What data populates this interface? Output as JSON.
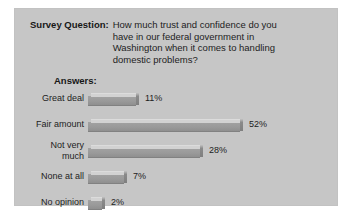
{
  "panel": {
    "background_color": "#c6c6c6",
    "page_background_color": "#ffffff"
  },
  "header": {
    "label": "Survey Question:",
    "question_lines": [
      "How much trust and confidence do you",
      "have in our federal government in",
      "Washington when it comes to handling",
      "domestic problems?"
    ],
    "question_full": "How much trust and confidence do you have in our federal government in Washington when it comes to handling domestic problems?"
  },
  "answers_heading": "Answers:",
  "chart_data": {
    "type": "bar",
    "orientation": "horizontal",
    "title": "How much trust and confidence do you have in our federal government in Washington when it comes to handling domestic problems?",
    "xlabel": "",
    "ylabel": "Answers",
    "grid": false,
    "legend": null,
    "value_suffix": "%",
    "categories": [
      "Great deal",
      "Fair amount",
      "Not very much",
      "None at all",
      "No opinion"
    ],
    "values": [
      11,
      52,
      28,
      7,
      2
    ],
    "value_labels": [
      "11%",
      "52%",
      "28%",
      "7%",
      "2%"
    ],
    "bar_pixel_widths": [
      48,
      152,
      112,
      36,
      14
    ],
    "bar_colors": {
      "front": "#9a9a9a",
      "top": "#d2d2d2",
      "cap": "#8a8a8a"
    }
  },
  "rows": [
    {
      "label": "Great deal",
      "label_lines": "Great deal",
      "value_label": "11%",
      "bar_width": 48,
      "two_line": false
    },
    {
      "label": "Fair amount",
      "label_lines": "Fair amount",
      "value_label": "52%",
      "bar_width": 152,
      "two_line": false
    },
    {
      "label": "Not very much",
      "label_lines": "Not very\nmuch",
      "value_label": "28%",
      "bar_width": 112,
      "two_line": true
    },
    {
      "label": "None at all",
      "label_lines": "None at all",
      "value_label": "7%",
      "bar_width": 36,
      "two_line": false
    },
    {
      "label": "No opinion",
      "label_lines": "No opinion",
      "value_label": "2%",
      "bar_width": 14,
      "two_line": false
    }
  ]
}
